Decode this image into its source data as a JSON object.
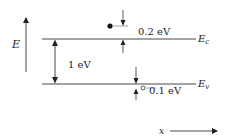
{
  "diagram": {
    "axis_label_energy": "E",
    "axis_label_position": "x",
    "band_edges": {
      "conduction": {
        "symbol": "E",
        "subscript": "c"
      },
      "valence": {
        "symbol": "E",
        "subscript": "v"
      }
    },
    "gap_label": "1 eV",
    "electron_offset_label": "0.2 eV",
    "hole_offset_label": "0.1 eV"
  }
}
